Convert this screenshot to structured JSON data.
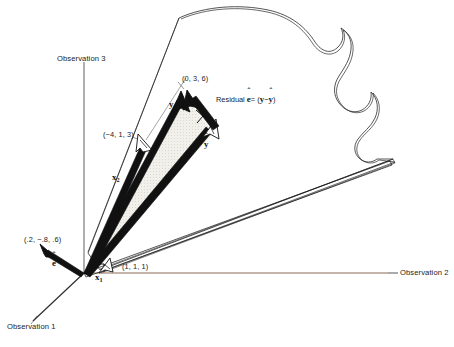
{
  "figure": {
    "background": "#ffffff",
    "width": 454,
    "height": 347
  },
  "axes": {
    "observation1": {
      "label": "Observation 1",
      "color": "#33312f"
    },
    "observation2": {
      "label": "Observation 2",
      "color": "#8a6a55"
    },
    "observation3": {
      "label": "Observation 3",
      "color": "#6e6e6e"
    }
  },
  "vectors": {
    "x1": {
      "name": "x1",
      "symbol": "x",
      "subscript": "1",
      "coordinate_label": "(1, 1, 1)"
    },
    "x2": {
      "name": "x2",
      "symbol": "x",
      "subscript": "2",
      "coordinate_label": "(−4, 1, 3)"
    },
    "y": {
      "name": "y",
      "symbol": "y",
      "coordinate_label": "(0, 3, 6)"
    },
    "yhat": {
      "name": "y-hat",
      "symbol": "y",
      "hat": "ˆ"
    },
    "ehat": {
      "name": "e-hat",
      "symbol": "e",
      "hat": "ˆ",
      "coordinate_label": "(.2, −.8, .6)"
    }
  },
  "annotations": {
    "residual": {
      "prefix": "Residual",
      "e_symbol": "e",
      "e_hat": "ˆ",
      "equals": "=",
      "open": "(",
      "y_symbol": "y",
      "minus": "−",
      "yhat_symbol": "y",
      "yhat_hat": "ˆ",
      "close": ")"
    }
  },
  "colors": {
    "plane_outline": "#2a2a2a",
    "vector_stroke": "#111111",
    "shaded_triangle": "#eeeeea",
    "hollow_arrow_fill": "#ffffff",
    "text": "#1a1a1a"
  },
  "page_header": {
    "text": ""
  }
}
